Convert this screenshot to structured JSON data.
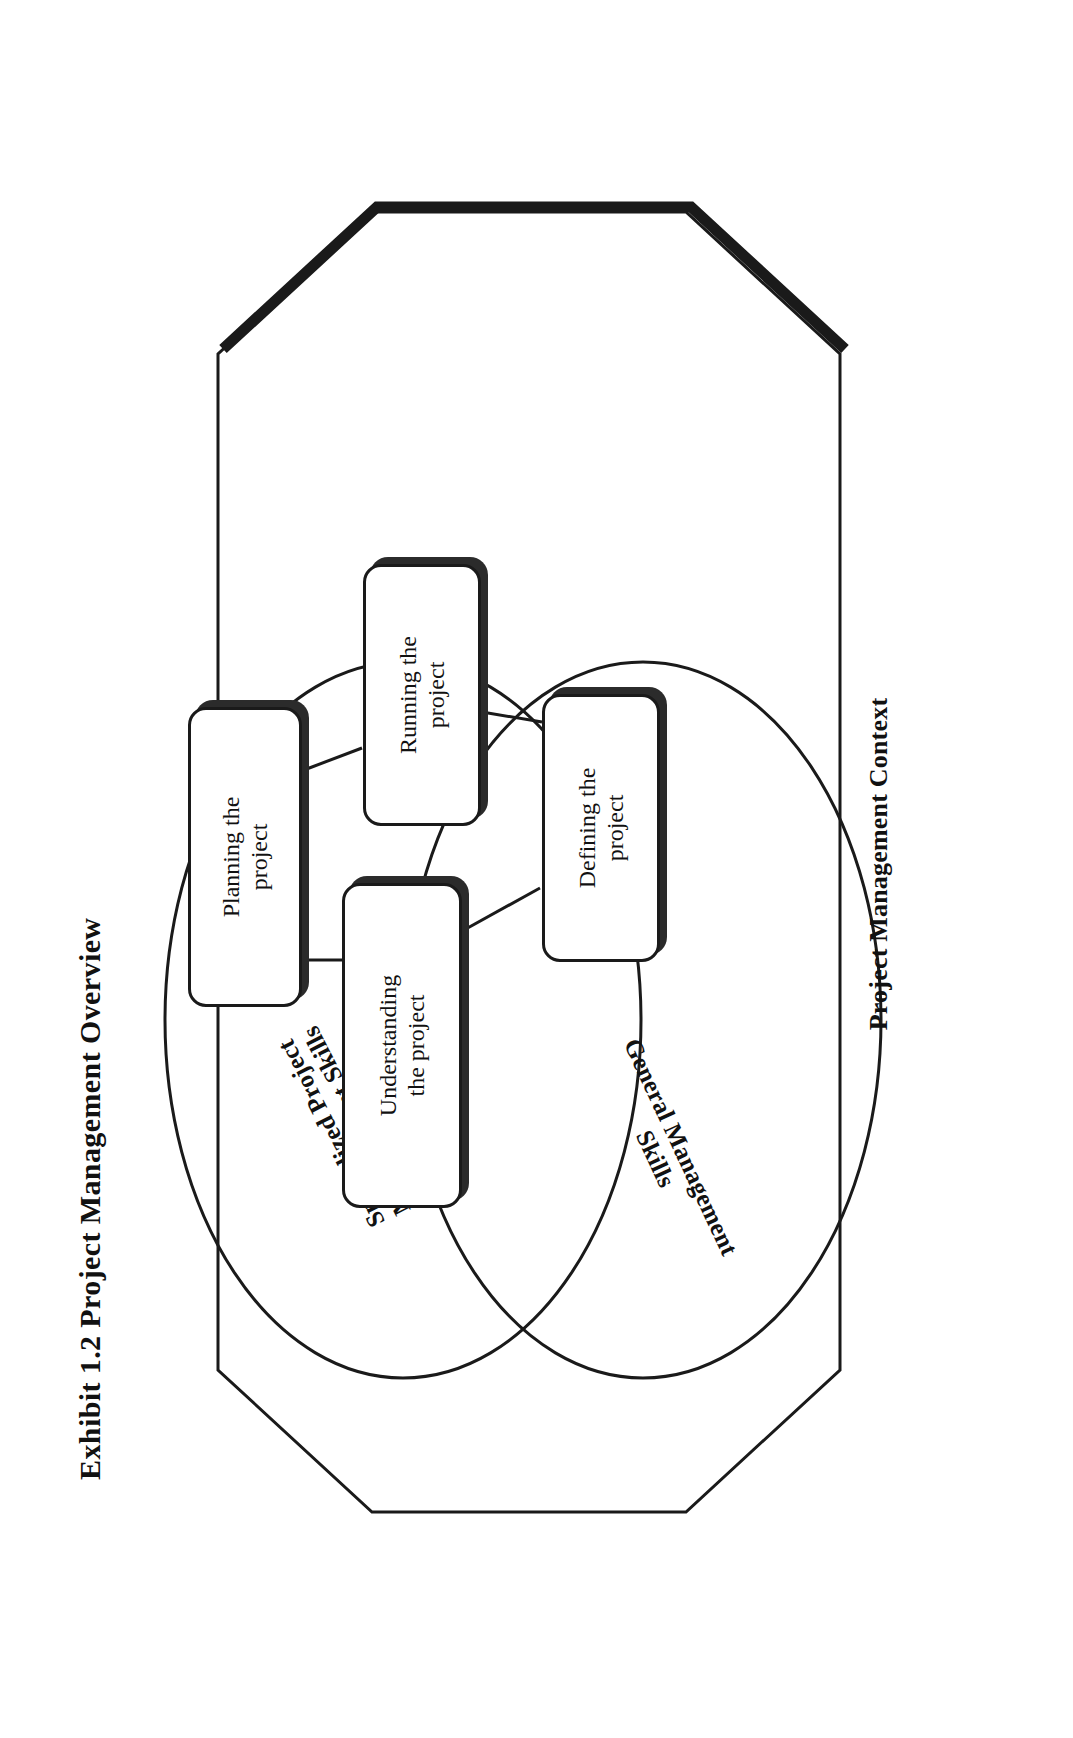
{
  "exhibit": {
    "title": "Exhibit 1.2  Project Management Overview"
  },
  "diagram": {
    "type": "venn-process-diagram",
    "outer_shape": {
      "name": "octagon",
      "label": "Project Management Context",
      "style": "outlined octagon with drop shadow on right/bottom edge",
      "stroke_color": "#1a1a1a",
      "fill_color": "#ffffff"
    },
    "ellipses": [
      {
        "id": "specialized",
        "label": "Specialized Project\nManagement Skills",
        "label_line1": "Specialized Project",
        "label_line2": "Management Skills",
        "stroke_color": "#1a1a1a",
        "fill_color": "#ffffff"
      },
      {
        "id": "general",
        "label": "General Management\nSkills",
        "label_line1": "General Management",
        "label_line2": "Skills",
        "stroke_color": "#1a1a1a",
        "fill_color": "#ffffff"
      }
    ],
    "boxes": [
      {
        "id": "understanding",
        "label": "Understanding\nthe project",
        "line1": "Understanding",
        "line2": "the project"
      },
      {
        "id": "planning",
        "label": "Planning the\nproject",
        "line1": "Planning the",
        "line2": "project"
      },
      {
        "id": "running",
        "label": "Running the\nproject",
        "line1": "Running the",
        "line2": "project"
      },
      {
        "id": "defining",
        "label": "Defining the\nproject",
        "line1": "Defining the",
        "line2": "project"
      }
    ],
    "connections": [
      {
        "from": "understanding",
        "to": "planning"
      },
      {
        "from": "understanding",
        "to": "defining"
      },
      {
        "from": "planning",
        "to": "running"
      },
      {
        "from": "defining",
        "to": "running"
      }
    ],
    "colors": {
      "ink": "#1a1a1a",
      "shadow": "#2b2b2b",
      "paper": "#ffffff"
    }
  }
}
